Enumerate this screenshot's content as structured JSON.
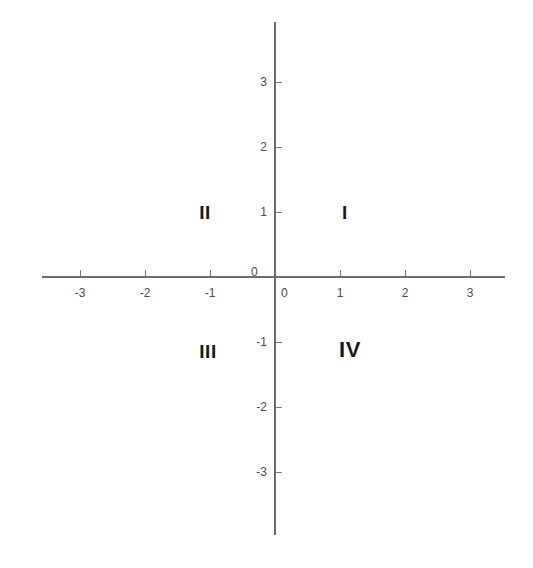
{
  "figure": {
    "type": "coordinate-plane",
    "background_color": "#ffffff",
    "axis_color": "#6b6b6b",
    "label_color": "#4a4a4a",
    "quadrant_label_color": "#1a1a1a"
  },
  "chart_data": {
    "type": "scatter",
    "title": "",
    "xlabel": "",
    "ylabel": "",
    "xlim": [
      -3.6,
      3.55
    ],
    "ylim": [
      -3.95,
      3.95
    ],
    "grid": false,
    "legend": null,
    "x_ticks": [
      -3,
      -2,
      -1,
      0,
      1,
      2,
      3
    ],
    "y_ticks": [
      -3,
      -2,
      -1,
      0,
      1,
      2,
      3
    ],
    "x_tick_labels": [
      "-3",
      "-2",
      "-1",
      "0",
      "1",
      "2",
      "3"
    ],
    "y_tick_labels": [
      "-3",
      "-2",
      "-1",
      "0",
      "1",
      "2",
      "3"
    ],
    "series": [],
    "annotations": [
      {
        "text": "I",
        "x": 1.15,
        "y": 1.0
      },
      {
        "text": "II",
        "x": -1.08,
        "y": 1.0
      },
      {
        "text": "III",
        "x": -1.05,
        "y": -1.13
      },
      {
        "text": "IV",
        "x": 1.15,
        "y": -1.13
      }
    ]
  },
  "axes": {
    "x_axis_name": "x-axis",
    "y_axis_name": "y-axis",
    "origin_label_x": "0",
    "origin_label_y": "0"
  },
  "ticks": {
    "x": [
      {
        "label": "-3",
        "value": -3
      },
      {
        "label": "-2",
        "value": -2
      },
      {
        "label": "-1",
        "value": -1
      },
      {
        "label": "1",
        "value": 1
      },
      {
        "label": "2",
        "value": 2
      },
      {
        "label": "3",
        "value": 3
      }
    ],
    "y": [
      {
        "label": "3",
        "value": 3
      },
      {
        "label": "2",
        "value": 2
      },
      {
        "label": "1",
        "value": 1
      },
      {
        "label": "-1",
        "value": -1
      },
      {
        "label": "-2",
        "value": -2
      },
      {
        "label": "-3",
        "value": -3
      }
    ]
  },
  "quadrants": [
    {
      "name": "quadrant-one",
      "label": "I"
    },
    {
      "name": "quadrant-two",
      "label": "II"
    },
    {
      "name": "quadrant-three",
      "label": "III"
    },
    {
      "name": "quadrant-four",
      "label": "IV"
    }
  ]
}
